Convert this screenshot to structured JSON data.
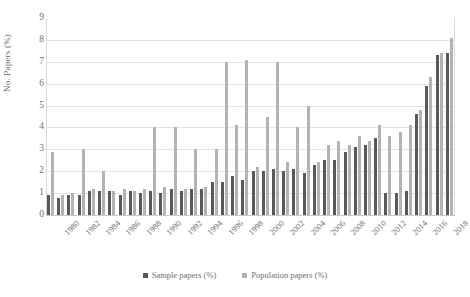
{
  "chart_data": {
    "type": "bar",
    "title": "",
    "xlabel": "",
    "ylabel": "No. Papers (%)",
    "ylim": [
      0,
      9
    ],
    "yticks": [
      0,
      1,
      2,
      3,
      4,
      5,
      6,
      7,
      8,
      9
    ],
    "grid": true,
    "legend_position": "bottom-center",
    "categories": [
      "1980",
      "1981",
      "1982",
      "1983",
      "1984",
      "1985",
      "1986",
      "1987",
      "1988",
      "1989",
      "1990",
      "1991",
      "1992",
      "1993",
      "1994",
      "1995",
      "1996",
      "1997",
      "1998",
      "1999",
      "2000",
      "2001",
      "2002",
      "2003",
      "2004",
      "2005",
      "2006",
      "2007",
      "2008",
      "2009",
      "2010",
      "2011",
      "2012",
      "2013",
      "2014",
      "2015",
      "2016",
      "2017",
      "2018",
      "2019"
    ],
    "tick_labels": [
      "1980",
      "",
      "1982",
      "",
      "1984",
      "",
      "1986",
      "",
      "1988",
      "",
      "1990",
      "",
      "1992",
      "",
      "1994",
      "",
      "1996",
      "",
      "1998",
      "",
      "2000",
      "",
      "2002",
      "",
      "2004",
      "",
      "2006",
      "",
      "2008",
      "",
      "2010",
      "",
      "2012",
      "",
      "2014",
      "",
      "2016",
      "",
      "2018",
      ""
    ],
    "series": [
      {
        "name": "Sample papers (%)",
        "color": "#595959",
        "values": [
          0.9,
          0.8,
          0.9,
          0.9,
          1.1,
          1.1,
          1.1,
          0.9,
          1.1,
          1.0,
          1.1,
          1.0,
          1.2,
          1.1,
          1.2,
          1.2,
          1.5,
          1.5,
          1.8,
          1.6,
          2.0,
          2.0,
          2.1,
          2.0,
          2.1,
          1.9,
          2.3,
          2.5,
          2.5,
          2.9,
          3.1,
          3.2,
          3.5,
          1.0,
          1.0,
          1.1,
          4.6,
          5.9,
          7.3,
          7.4
        ]
      },
      {
        "name": "Population papers (%)",
        "color": "#b3b3b3",
        "values": [
          2.9,
          0.9,
          1.0,
          3.0,
          1.2,
          2.0,
          1.1,
          1.2,
          1.1,
          1.2,
          4.0,
          1.3,
          4.0,
          1.2,
          3.0,
          1.3,
          3.0,
          7.0,
          4.1,
          7.1,
          2.2,
          4.5,
          7.0,
          2.4,
          4.0,
          5.0,
          2.4,
          3.2,
          3.4,
          3.2,
          3.6,
          3.4,
          4.1,
          3.6,
          3.8,
          4.1,
          4.8,
          6.3,
          7.4,
          8.1
        ]
      }
    ]
  },
  "legend": {
    "items": [
      {
        "label": "Sample papers (%)",
        "color": "#595959"
      },
      {
        "label": "Population papers (%)",
        "color": "#b3b3b3"
      }
    ]
  }
}
